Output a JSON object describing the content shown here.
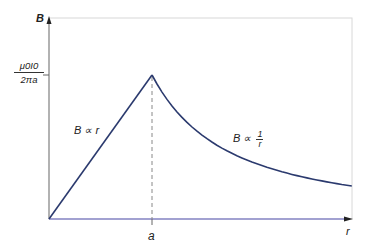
{
  "chart_data": {
    "type": "line",
    "title": "",
    "xlabel": "r",
    "ylabel": "B",
    "x_ticks": [
      {
        "value": "a",
        "label": "a"
      }
    ],
    "y_ticks": [
      {
        "value": "mu0 I0 / (2 pi a)",
        "label": "μ0I0 / 2πa"
      }
    ],
    "grid": false,
    "legend": null,
    "series": [
      {
        "name": "B ∝ r (inside, r < a)",
        "points": [
          [
            0,
            0
          ],
          [
            1,
            1
          ]
        ]
      },
      {
        "name": "B ∝ 1/r (outside, r > a)",
        "points": [
          [
            1,
            1
          ],
          [
            1.25,
            0.8
          ],
          [
            1.5,
            0.667
          ],
          [
            1.75,
            0.571
          ],
          [
            2.0,
            0.5
          ],
          [
            2.25,
            0.444
          ],
          [
            2.5,
            0.4
          ],
          [
            2.75,
            0.364
          ],
          [
            2.94,
            0.34
          ]
        ]
      }
    ],
    "x_units": "multiples of a",
    "y_units": "multiples of mu0 I0 / (2 pi a)",
    "xlim": [
      0,
      2.94
    ],
    "ylim": [
      0,
      1.4
    ],
    "annotations": [
      {
        "text": "B ∝ r",
        "near": "rising segment"
      },
      {
        "text": "B ∝ 1/r",
        "near": "falling curve"
      },
      {
        "text": "dashed vertical line at r = a",
        "near": "peak"
      }
    ],
    "colors": {
      "curve": "#2b3a6e",
      "x_axis": "#8a88c8",
      "y_axis": "#8c8c8c",
      "frame": "#d8d8d8",
      "dashed": "#888888"
    }
  },
  "labels": {
    "y_axis": "B",
    "x_axis": "r",
    "x_tick": "a",
    "y_tick_num": "μ0I0",
    "y_tick_den": "2πa",
    "inside_relation": "B ∝ r",
    "outside_relation_prefix": "B ∝",
    "outside_relation_num": "1",
    "outside_relation_den": "r"
  }
}
